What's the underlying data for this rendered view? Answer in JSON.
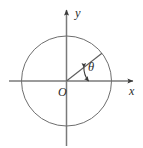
{
  "figure": {
    "kind": "unit-circle-angle-diagram",
    "width": 143,
    "height": 148,
    "background_color": "#ffffff"
  },
  "labels": {
    "x_axis": "x",
    "y_axis": "y",
    "origin": "O",
    "angle": "θ"
  },
  "colors": {
    "axis": "#7a7a7a",
    "circle": "#6e6e6e",
    "ray": "#5c5c5c",
    "arc": "#3a3a3a",
    "text": "#2b2b2b",
    "arrowhead": "#3a3a3a"
  },
  "geometry": {
    "origin": {
      "x": 66.5,
      "y": 81
    },
    "circle_radius": 45,
    "x_axis": {
      "start_x": 9,
      "end_x": 136,
      "y": 81
    },
    "y_axis": {
      "x": 66.5,
      "start_y": 8,
      "end_y": 146
    },
    "ray": {
      "end_x": 103.5,
      "end_y": 48.5,
      "angle_degrees": 38
    },
    "arc_radius": 22,
    "arc_start_degrees": 0,
    "arc_end_degrees": 38
  },
  "label_positions": {
    "x_axis": {
      "x": 129,
      "y": 95
    },
    "y_axis": {
      "x": 75,
      "y": 17
    },
    "origin": {
      "x": 58,
      "y": 96
    },
    "angle": {
      "x": 88,
      "y": 71
    }
  }
}
